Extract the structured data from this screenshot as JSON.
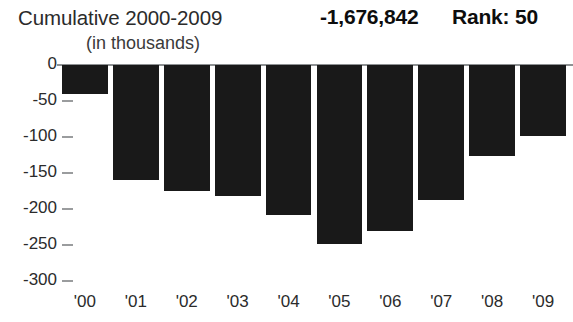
{
  "header": {
    "title": "Cumulative 2000-2009",
    "total_value": "-1,676,842",
    "rank_label": "Rank: 50",
    "units_label": "(in thousands)"
  },
  "chart_data": {
    "type": "bar",
    "title": "Cumulative 2000-2009",
    "subtitle": "(in thousands)",
    "xlabel": "",
    "ylabel": "",
    "categories": [
      "'00",
      "'01",
      "'02",
      "'03",
      "'04",
      "'05",
      "'06",
      "'07",
      "'08",
      "'09"
    ],
    "values": [
      -40,
      -160,
      -175,
      -182,
      -208,
      -248,
      -230,
      -188,
      -126,
      -98
    ],
    "ylim": [
      -300,
      0
    ],
    "ytick_labels": [
      "0",
      "-50",
      "-100",
      "-150",
      "-200",
      "-250",
      "-300"
    ],
    "ytick_values": [
      0,
      -50,
      -100,
      -150,
      -200,
      -250,
      -300
    ],
    "grid": false,
    "legend": false,
    "bar_color": "#191919",
    "axis_color": "#8e9193",
    "cumulative_total": "-1,676,842",
    "rank": "Rank: 50"
  }
}
